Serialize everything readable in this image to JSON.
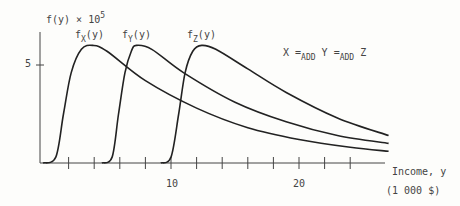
{
  "chart_data": {
    "type": "line",
    "title": "",
    "xlabel": "Income, y",
    "xunit": "(1 000 $)",
    "ylabel_base": "f(y) × 10",
    "ylabel_exp": "5",
    "xlim": [
      0,
      27
    ],
    "ylim": [
      0,
      7
    ],
    "x_ticks": [
      2,
      4,
      6,
      8,
      10,
      12,
      14,
      16,
      18,
      20,
      22,
      24
    ],
    "x_tick_labels": {
      "10": "10",
      "20": "20"
    },
    "y_tick_labels": {
      "5": "5"
    },
    "annotation": {
      "X": "X",
      "eq": "=",
      "sub": "ADD",
      "Y": "Y",
      "Z": "Z"
    },
    "series": [
      {
        "name": "f_X(y)",
        "label_base": "f",
        "label_sub": "X",
        "label_tail": "(y)",
        "start": 0,
        "peak_x": 3.9,
        "peak_y": 6.0,
        "points": [
          [
            0,
            0
          ],
          [
            1,
            0.3
          ],
          [
            1.6,
            2.5
          ],
          [
            2.2,
            4.6
          ],
          [
            3,
            5.8
          ],
          [
            3.9,
            6.0
          ],
          [
            5,
            5.7
          ],
          [
            8,
            4.2
          ],
          [
            12,
            2.8
          ],
          [
            16,
            1.8
          ],
          [
            20,
            1.2
          ],
          [
            24,
            0.8
          ],
          [
            27,
            0.6
          ]
        ]
      },
      {
        "name": "f_Y(y)",
        "label_base": "f",
        "label_sub": "Y",
        "label_tail": "(y)",
        "start": 4.6,
        "peak_x": 7.3,
        "peak_y": 6.0,
        "points": [
          [
            4.6,
            0
          ],
          [
            5.4,
            0.3
          ],
          [
            5.9,
            2.5
          ],
          [
            6.4,
            4.6
          ],
          [
            6.9,
            5.7
          ],
          [
            7.3,
            6.0
          ],
          [
            8.5,
            5.8
          ],
          [
            11,
            4.6
          ],
          [
            15,
            3.1
          ],
          [
            19,
            2.1
          ],
          [
            23,
            1.4
          ],
          [
            27,
            1.0
          ]
        ]
      },
      {
        "name": "f_Z(y)",
        "label_base": "f",
        "label_sub": "Z",
        "label_tail": "(y)",
        "start": 9.2,
        "peak_x": 12.4,
        "peak_y": 6.0,
        "points": [
          [
            9.2,
            0
          ],
          [
            10,
            0.3
          ],
          [
            10.6,
            2.5
          ],
          [
            11.1,
            4.6
          ],
          [
            11.7,
            5.7
          ],
          [
            12.4,
            6.0
          ],
          [
            13.5,
            5.8
          ],
          [
            16,
            4.8
          ],
          [
            19,
            3.6
          ],
          [
            23,
            2.3
          ],
          [
            27,
            1.4
          ]
        ]
      }
    ]
  }
}
